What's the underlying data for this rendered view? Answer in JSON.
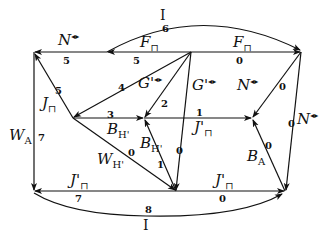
{
  "diagram": {
    "type": "directed-graph",
    "symbols": {
      "box": "⊓",
      "bowtie": "◂▸"
    },
    "edges": [
      {
        "id": "top-arc",
        "label": "I",
        "weight": "6"
      },
      {
        "id": "top-left",
        "label": "N",
        "sup": "◂▸",
        "weight": "5"
      },
      {
        "id": "top-mid",
        "label": "F",
        "sub": "⊓",
        "weight": "5"
      },
      {
        "id": "top-right",
        "label": "F",
        "sub": "⊓",
        "weight": "0"
      },
      {
        "id": "diag-left-top",
        "label": "J",
        "sub": "⊓",
        "weight": "5"
      },
      {
        "id": "diag-four",
        "label": "G'",
        "sup": "◂▸",
        "weight": "4"
      },
      {
        "id": "diag-two",
        "weight": "2"
      },
      {
        "id": "vert-center",
        "label": "G'",
        "sup": "◂▸",
        "weight": "0"
      },
      {
        "id": "right-diag",
        "label": "N",
        "sup": "◂▸",
        "weight": "0"
      },
      {
        "id": "right-vert",
        "label": "N",
        "sup": "◂▸",
        "weight": "0"
      },
      {
        "id": "mid-left",
        "label": "B",
        "sub": "H'",
        "weight": "3"
      },
      {
        "id": "mid-right",
        "label": "J'",
        "sub": "⊓",
        "weight": "1"
      },
      {
        "id": "left-vert",
        "label": "W",
        "sub": "A",
        "weight": "7"
      },
      {
        "id": "w-diag",
        "label": "W",
        "sub": "H'",
        "weight": "0"
      },
      {
        "id": "b-diag",
        "label": "B",
        "sub": "H'",
        "weight": "1"
      },
      {
        "id": "ba-diag",
        "label": "B",
        "sub": "A",
        "weight": "0"
      },
      {
        "id": "bottom-left",
        "label": "J'",
        "sub": "⊓",
        "weight": "7"
      },
      {
        "id": "bottom-right",
        "label": "J'",
        "sub": "⊓",
        "weight": "0"
      },
      {
        "id": "bottom-arc",
        "label": "I",
        "weight": "8"
      }
    ]
  }
}
